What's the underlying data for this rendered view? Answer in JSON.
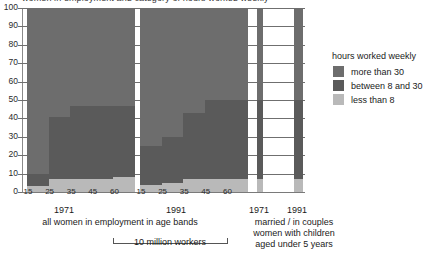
{
  "title_clipped": "women in employment and category of hours worked weekly",
  "chart_data": {
    "type": "bar",
    "title": "women in employment and category of hours worked weekly",
    "xlabel": "",
    "ylabel": "",
    "ylim": [
      0,
      100
    ],
    "yticks": [
      0,
      10,
      20,
      30,
      40,
      50,
      60,
      70,
      80,
      90,
      100
    ],
    "grid": true,
    "legend_position": "right",
    "legend_title": "hours worked weekly",
    "stacked": true,
    "series": [
      {
        "name": "more than 30",
        "color": "#6d6d6d"
      },
      {
        "name": "between 8 and 30",
        "color": "#5a5a5a"
      },
      {
        "name": "less than 8",
        "color": "#b9b9b9"
      }
    ],
    "groups": [
      {
        "name": "1971",
        "caption": "all women in employment in age bands",
        "x_axis_type": "age bands",
        "categories": [
          "15",
          "25",
          "35",
          "45",
          "60"
        ],
        "bars": [
          {
            "age_band": "15-24",
            "less_than_8": 3,
            "between_8_and_30": 7,
            "more_than_30": 90
          },
          {
            "age_band": "25-34",
            "less_than_8": 7,
            "between_8_and_30": 34,
            "more_than_30": 59
          },
          {
            "age_band": "35-44",
            "less_than_8": 7,
            "between_8_and_30": 40,
            "more_than_30": 53
          },
          {
            "age_band": "45-59",
            "less_than_8": 7,
            "between_8_and_30": 40,
            "more_than_30": 53
          },
          {
            "age_band": "60+",
            "less_than_8": 8,
            "between_8_and_30": 39,
            "more_than_30": 53
          }
        ]
      },
      {
        "name": "1991",
        "caption": "all women in employment in age bands",
        "x_axis_type": "age bands",
        "categories": [
          "15",
          "25",
          "35",
          "45",
          "60"
        ],
        "bars": [
          {
            "age_band": "15-24",
            "less_than_8": 4,
            "between_8_and_30": 21,
            "more_than_30": 75
          },
          {
            "age_band": "25-34",
            "less_than_8": 5,
            "between_8_and_30": 25,
            "more_than_30": 70
          },
          {
            "age_band": "35-44",
            "less_than_8": 7,
            "between_8_and_30": 36,
            "more_than_30": 57
          },
          {
            "age_band": "45-59",
            "less_than_8": 7,
            "between_8_and_30": 43,
            "more_than_30": 50
          },
          {
            "age_band": "60+",
            "less_than_8": 7,
            "between_8_and_30": 43,
            "more_than_30": 50
          }
        ]
      },
      {
        "name": "married / in couples women with children aged under 5 years",
        "caption": "married / in couples women with children aged under 5 years",
        "x_axis_type": "years",
        "categories": [
          "1971",
          "1991"
        ],
        "bars": [
          {
            "year": "1971",
            "less_than_8": 7,
            "between_8_and_30": 43,
            "more_than_30": 50
          },
          {
            "year": "1991",
            "less_than_8": 7,
            "between_8_and_30": 43,
            "more_than_30": 50
          }
        ]
      }
    ],
    "annotations": [
      {
        "text": "10 million workers",
        "type": "bracket",
        "spans": "1971 and 1991 age-band groups"
      }
    ]
  },
  "axis": {
    "y_labels": [
      "100",
      "90",
      "80",
      "70",
      "60",
      "50",
      "40",
      "30",
      "20",
      "10",
      "0"
    ]
  },
  "left_section": {
    "group1": {
      "label": "1971",
      "ticks": [
        "15",
        "25",
        "35",
        "45",
        "60"
      ]
    },
    "group2": {
      "label": "1991",
      "ticks": [
        "15",
        "25",
        "35",
        "45",
        "60"
      ]
    },
    "caption": "all women in employment in age bands",
    "bracket_label": "10 million workers"
  },
  "right_section": {
    "tick1": "1971",
    "tick2": "1991",
    "caption_line1": "married / in couples",
    "caption_line2": "women with children",
    "caption_line3": "aged under 5 years"
  },
  "legend": {
    "title": "hours worked weekly",
    "items": [
      {
        "label": "more than 30",
        "color": "#6d6d6d"
      },
      {
        "label": "between 8 and 30",
        "color": "#5a5a5a"
      },
      {
        "label": "less than 8",
        "color": "#b9b9b9"
      }
    ]
  }
}
